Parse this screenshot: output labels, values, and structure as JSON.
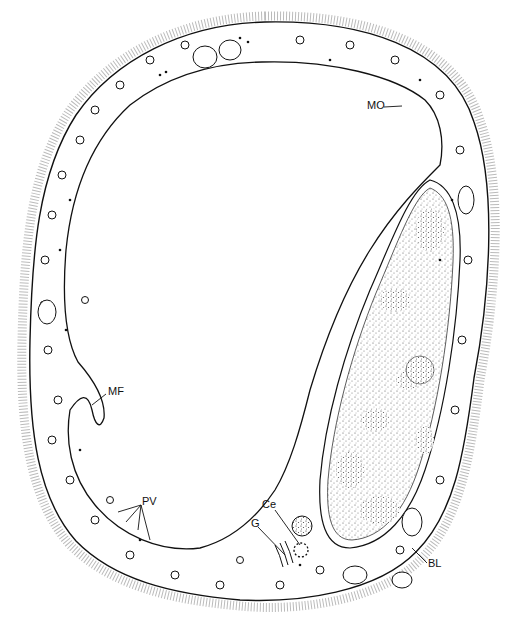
{
  "figure": {
    "labels": [
      {
        "id": "MO",
        "text": "MO",
        "x": 367,
        "y": 104
      },
      {
        "id": "MF",
        "text": "MF",
        "x": 108,
        "y": 389
      },
      {
        "id": "PV",
        "text": "PV",
        "x": 142,
        "y": 500
      },
      {
        "id": "Ce",
        "text": "Ce",
        "x": 262,
        "y": 503
      },
      {
        "id": "G",
        "text": "G",
        "x": 251,
        "y": 522
      },
      {
        "id": "BL",
        "text": "BL",
        "x": 428,
        "y": 561
      }
    ]
  }
}
